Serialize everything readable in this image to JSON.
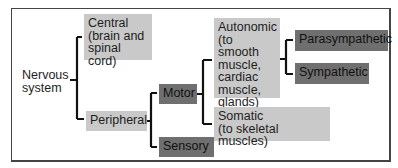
{
  "diagram": {
    "type": "hierarchy",
    "root": {
      "label": "Nervous system"
    },
    "nodes": {
      "central": {
        "label": "Central (brain and spinal cord)",
        "lines": [
          "Central",
          "(brain and",
          "spinal cord)"
        ]
      },
      "peripheral": {
        "label": "Peripheral"
      },
      "motor": {
        "label": "Motor"
      },
      "sensory": {
        "label": "Sensory"
      },
      "autonomic": {
        "label": "Autonomic (to smooth muscle, cardiac muscle, glands)",
        "lines": [
          "Autonomic",
          "(to smooth",
          "muscle,",
          "cardiac",
          "muscle,",
          "glands)"
        ]
      },
      "somatic": {
        "label": "Somatic (to skeletal muscles)",
        "lines": [
          "Somatic",
          "(to skeletal muscles)"
        ]
      },
      "parasympathetic": {
        "label": "Parasympathetic"
      },
      "sympathetic": {
        "label": "Sympathetic"
      }
    },
    "edges": [
      [
        "Nervous system",
        "Central"
      ],
      [
        "Nervous system",
        "Peripheral"
      ],
      [
        "Peripheral",
        "Motor"
      ],
      [
        "Peripheral",
        "Sensory"
      ],
      [
        "Motor",
        "Autonomic"
      ],
      [
        "Motor",
        "Somatic"
      ],
      [
        "Autonomic",
        "Parasympathetic"
      ],
      [
        "Autonomic",
        "Sympathetic"
      ]
    ],
    "colors": {
      "light_box": "#c9c9c9",
      "dark_box": "#6f6f6f",
      "line": "#111111",
      "frame": "#444444"
    }
  }
}
